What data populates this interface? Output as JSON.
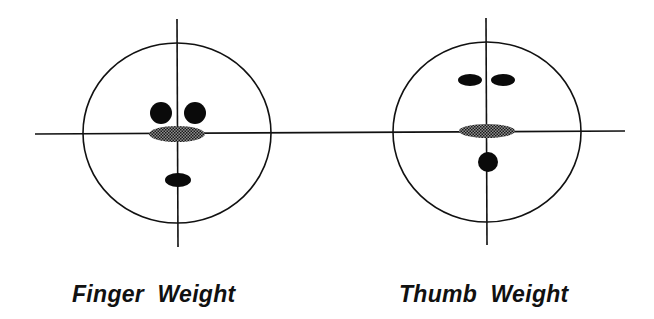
{
  "diagram": {
    "panels": [
      {
        "id": "finger-weight",
        "caption": "Finger  Weight",
        "circle": {
          "cx": 177,
          "cy": 133,
          "rx": 94,
          "ry": 90
        },
        "vertical_line": {
          "x1": 177,
          "y1": 19,
          "x2": 178,
          "y2": 247
        },
        "features": [
          {
            "name": "left-eye",
            "shape": "circle",
            "cx": 161,
            "cy": 113,
            "rx": 11,
            "ry": 11,
            "fill": "solid"
          },
          {
            "name": "right-eye",
            "shape": "circle",
            "cx": 195,
            "cy": 113,
            "rx": 11,
            "ry": 11,
            "fill": "solid"
          },
          {
            "name": "center-mark",
            "shape": "ellipse",
            "cx": 177,
            "cy": 134,
            "rx": 28,
            "ry": 8,
            "fill": "hatched"
          },
          {
            "name": "mouth",
            "shape": "ellipse",
            "cx": 178,
            "cy": 180,
            "rx": 13,
            "ry": 7,
            "fill": "solid"
          }
        ]
      },
      {
        "id": "thumb-weight",
        "caption": "Thumb  Weight",
        "circle": {
          "cx": 487,
          "cy": 132,
          "rx": 94,
          "ry": 90
        },
        "vertical_line": {
          "x1": 486,
          "y1": 18,
          "x2": 487,
          "y2": 245
        },
        "features": [
          {
            "name": "left-eye",
            "shape": "ellipse",
            "cx": 470,
            "cy": 80,
            "rx": 12,
            "ry": 6,
            "fill": "solid"
          },
          {
            "name": "right-eye",
            "shape": "ellipse",
            "cx": 503,
            "cy": 80,
            "rx": 12,
            "ry": 6,
            "fill": "solid"
          },
          {
            "name": "center-mark",
            "shape": "ellipse",
            "cx": 487,
            "cy": 131,
            "rx": 28,
            "ry": 7,
            "fill": "hatched"
          },
          {
            "name": "chin-dot",
            "shape": "circle",
            "cx": 488,
            "cy": 162,
            "rx": 10,
            "ry": 10,
            "fill": "solid"
          }
        ]
      }
    ],
    "horizontal_line": {
      "x1": 35,
      "y1": 134,
      "x2": 625,
      "y2": 131
    },
    "colors": {
      "stroke": "#111111",
      "solid_fill": "#0a0a0a",
      "hatched_dark": "#1a1a1a",
      "hatched_light": "#9a9a9a",
      "background": "#ffffff"
    }
  }
}
